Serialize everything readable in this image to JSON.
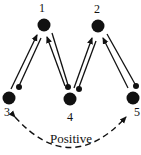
{
  "diagram": {
    "nodes": [
      {
        "id": "1",
        "label": "1",
        "x": 44,
        "y": 25,
        "label_x": 42,
        "label_y": 8
      },
      {
        "id": "2",
        "label": "2",
        "x": 98,
        "y": 26,
        "label_x": 97,
        "label_y": 9
      },
      {
        "id": "3",
        "label": "3",
        "x": 9,
        "y": 98,
        "label_x": 7,
        "label_y": 112
      },
      {
        "id": "4",
        "label": "4",
        "x": 70,
        "y": 99,
        "label_x": 70,
        "label_y": 117
      },
      {
        "id": "5",
        "label": "5",
        "x": 133,
        "y": 98,
        "label_x": 137,
        "label_y": 112
      }
    ],
    "edges": [
      {
        "from": "3",
        "to": "1",
        "type": "arrow-and-ball-stick"
      },
      {
        "from": "4",
        "to": "1",
        "type": "arrow-and-ball-stick"
      },
      {
        "from": "4",
        "to": "2",
        "type": "arrow-and-ball-stick"
      },
      {
        "from": "5",
        "to": "2",
        "type": "arrow-and-ball-stick"
      }
    ],
    "feedback": {
      "from": "3",
      "to": "5",
      "style": "dashed",
      "direction": "bidirectional",
      "label": "Positive"
    },
    "colors": {
      "ink": "#111111",
      "background": "#ffffff"
    }
  }
}
